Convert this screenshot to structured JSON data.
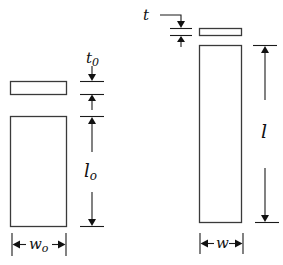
{
  "diagram": {
    "type": "dimension-drawing",
    "colors": {
      "stroke": "#3a3a3a",
      "text": "#111111",
      "background": "#ffffff"
    },
    "left_specimen": {
      "plate_label": "t",
      "plate_label_sub": "0",
      "length_label": "l",
      "length_label_sub": "o",
      "width_label": "w",
      "width_label_sub": "o"
    },
    "right_specimen": {
      "plate_label": "t",
      "length_label": "l",
      "width_label": "w"
    }
  }
}
